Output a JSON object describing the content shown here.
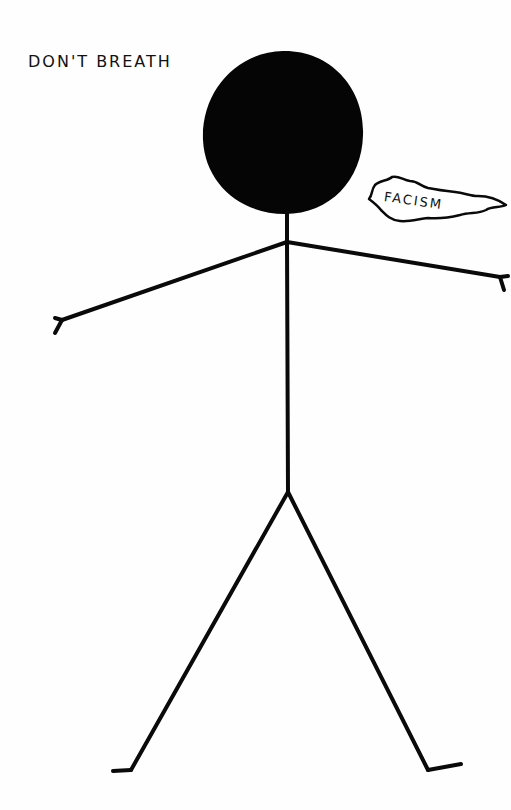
{
  "drawing": {
    "caption": "DON'T BREATH",
    "speech_bubble_text": "FACISM",
    "figure": "stick-figure",
    "colors": {
      "ink": "#0a0a0a",
      "paper": "#fefefe"
    }
  }
}
